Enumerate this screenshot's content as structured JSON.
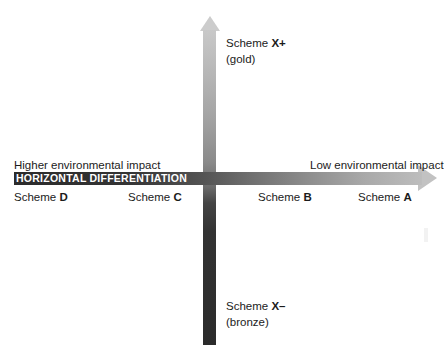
{
  "chart_data": {
    "type": "scatter",
    "title": "",
    "xlabel": "HORIZONTAL DIFFERENTIATION",
    "ylabel": "VERTICAL DIFFERENTATION",
    "x_axis": {
      "caption": "HORIZONTAL DIFFERENTIATION",
      "left_end_label": "Higher environmental impact",
      "right_end_label": "Low environmental impact",
      "direction": "left = higher environmental impact, right = low environmental impact",
      "tick_labels": [
        "Scheme D",
        "Scheme C",
        "Scheme B",
        "Scheme A"
      ]
    },
    "y_axis": {
      "caption": "VERTICAL DIFFERENTATION",
      "top_label": "Scheme X+",
      "top_sublabel": "(gold)",
      "bottom_label": "Scheme X–",
      "bottom_sublabel": "(bronze)",
      "direction": "top = gold tier, bottom = bronze tier"
    },
    "categories": [
      "Scheme D",
      "Scheme C",
      "Scheme B",
      "Scheme A",
      "Scheme X+",
      "Scheme X–"
    ],
    "points": [
      {
        "label": "Scheme D",
        "axis": "horizontal",
        "position": "far-left",
        "x": -0.85,
        "y": 0
      },
      {
        "label": "Scheme C",
        "axis": "horizontal",
        "position": "mid-left",
        "x": -0.3,
        "y": 0
      },
      {
        "label": "Scheme B",
        "axis": "horizontal",
        "position": "mid-right",
        "x": 0.3,
        "y": 0
      },
      {
        "label": "Scheme A",
        "axis": "horizontal",
        "position": "far-right",
        "x": 0.8,
        "y": 0
      },
      {
        "label": "Scheme X+",
        "axis": "vertical",
        "position": "top",
        "x": 0,
        "y": 0.9
      },
      {
        "label": "Scheme X–",
        "axis": "vertical",
        "position": "bottom",
        "x": 0,
        "y": -0.85
      }
    ],
    "grid": false,
    "legend": "none"
  },
  "axes": {
    "horizontal": {
      "caption": "HORIZONTAL DIFFERENTIATION",
      "left_label": "Higher environmental impact",
      "right_label": "Low environmental impact",
      "shaft_dark_color": "#2b2b2b",
      "shaft_light_color": "#bdbdbd",
      "arrowhead_color": "#c2c2c2",
      "caption_color": "#ffffff"
    },
    "vertical": {
      "caption": "VERTICAL DIFFERENTATION",
      "top_label": "Scheme X+",
      "top_sublabel": "(gold)",
      "bottom_label": "Scheme X–",
      "bottom_sublabel": "(bronze)",
      "shaft_light_color": "#c8c8c8",
      "shaft_dark_color": "#2b2b2b",
      "arrowhead_color": "#cccccc",
      "caption_color": "#ffffff"
    }
  },
  "scheme_labels": {
    "d": {
      "prefix": "Scheme ",
      "key": "D"
    },
    "c": {
      "prefix": "Scheme ",
      "key": "C"
    },
    "b": {
      "prefix": "Scheme ",
      "key": "B"
    },
    "a": {
      "prefix": "Scheme ",
      "key": "A"
    },
    "x_plus": {
      "prefix": "Scheme ",
      "key": "X+",
      "sub": "(gold)"
    },
    "x_minus": {
      "prefix": "Scheme ",
      "key": "X–",
      "sub": "(bronze)"
    }
  },
  "colors": {
    "background": "#ffffff",
    "text": "#1b1b1b",
    "axis_caption_text": "#ffffff"
  }
}
